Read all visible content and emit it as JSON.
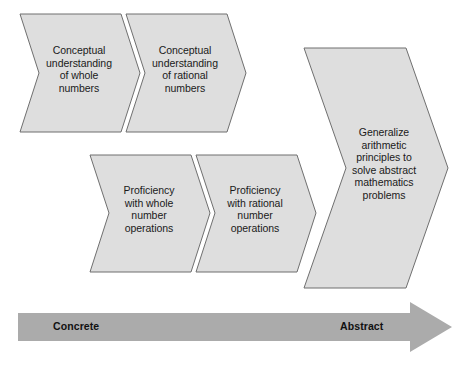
{
  "diagram": {
    "colors": {
      "chevron_fill": "#dedede",
      "chevron_stroke": "#6f6f6f",
      "arrow_fill": "#ababab",
      "text": "#1a1a1a",
      "background": "#ffffff"
    },
    "rows": [
      {
        "row_name": "conceptual-understanding-row",
        "chevrons": [
          {
            "id": "conceptual-whole",
            "text": "Conceptual\nunderstanding\nof whole\nnumbers"
          },
          {
            "id": "conceptual-rational",
            "text": "Conceptual\nunderstanding\nof rational\nnumbers"
          }
        ]
      },
      {
        "row_name": "proficiency-row",
        "chevrons": [
          {
            "id": "proficiency-whole",
            "text": "Proficiency\nwith whole\nnumber\noperations"
          },
          {
            "id": "proficiency-rational",
            "text": "Proficiency\nwith rational\nnumber\noperations"
          }
        ]
      }
    ],
    "outcome": {
      "id": "generalize-outcome",
      "text": "Generalize\narithmetic\nprinciples to\nsolve abstract\nmathematics\nproblems"
    },
    "axis": {
      "id": "concrete-abstract-arrow",
      "start_label": "Concrete",
      "end_label": "Abstract",
      "direction": "left-to-right"
    }
  }
}
